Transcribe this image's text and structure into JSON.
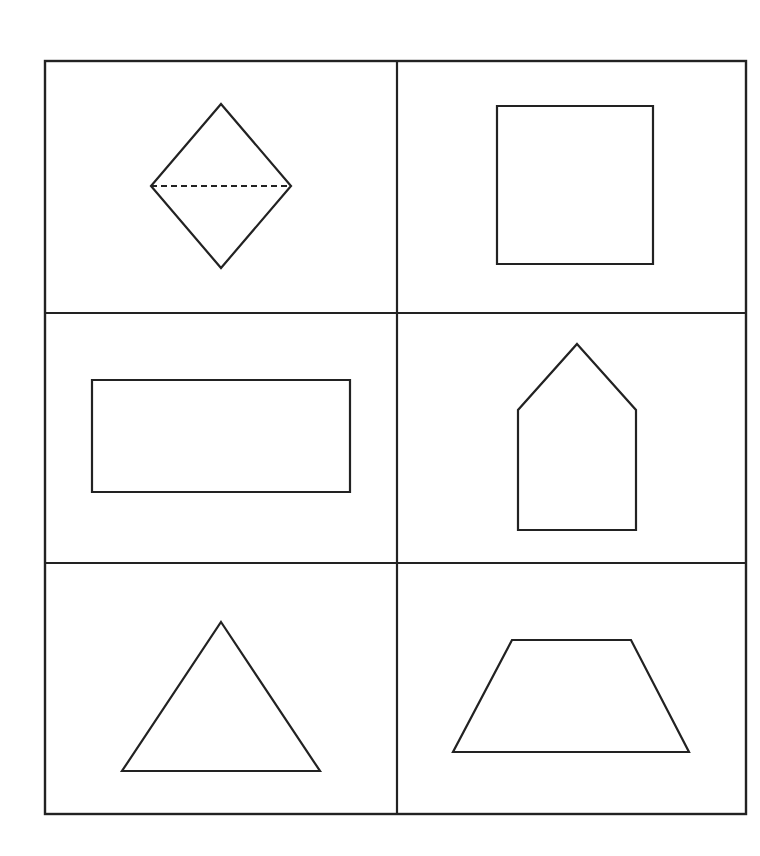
{
  "diagram": {
    "type": "shape-grid",
    "rows": 3,
    "columns": 2,
    "stroke_color": "#222222",
    "background_color": "#ffffff",
    "grid": {
      "left": 45,
      "top": 61,
      "right": 746,
      "bottom": 814,
      "col_divider_x": 397,
      "row_divider_y": [
        313,
        563
      ]
    },
    "cells": [
      {
        "row": 0,
        "col": 0,
        "shape": "rhombus",
        "label": "diamond-with-dashed-diagonal",
        "points": [
          [
            221,
            104
          ],
          [
            291,
            186
          ],
          [
            221,
            268
          ],
          [
            151,
            186
          ]
        ],
        "dashed_line": [
          [
            151,
            186
          ],
          [
            291,
            186
          ]
        ]
      },
      {
        "row": 0,
        "col": 1,
        "shape": "square",
        "label": "square",
        "points": [
          [
            497,
            106
          ],
          [
            653,
            106
          ],
          [
            653,
            264
          ],
          [
            497,
            264
          ]
        ]
      },
      {
        "row": 1,
        "col": 0,
        "shape": "rectangle",
        "label": "rectangle",
        "points": [
          [
            92,
            380
          ],
          [
            350,
            380
          ],
          [
            350,
            492
          ],
          [
            92,
            492
          ]
        ]
      },
      {
        "row": 1,
        "col": 1,
        "shape": "pentagon",
        "label": "house-pentagon",
        "points": [
          [
            577,
            344
          ],
          [
            636,
            410
          ],
          [
            636,
            530
          ],
          [
            518,
            530
          ],
          [
            518,
            410
          ]
        ]
      },
      {
        "row": 2,
        "col": 0,
        "shape": "triangle",
        "label": "triangle",
        "points": [
          [
            221,
            622
          ],
          [
            320,
            771
          ],
          [
            122,
            771
          ]
        ]
      },
      {
        "row": 2,
        "col": 1,
        "shape": "trapezoid",
        "label": "trapezoid",
        "points": [
          [
            512,
            640
          ],
          [
            631,
            640
          ],
          [
            689,
            752
          ],
          [
            453,
            752
          ]
        ]
      }
    ]
  }
}
